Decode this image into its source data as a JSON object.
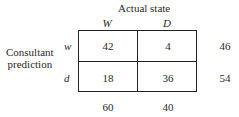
{
  "table": {
    "column_title": "Actual state",
    "row_title_line1": "Consultant",
    "row_title_line2": "prediction",
    "columns": [
      "W",
      "D"
    ],
    "rows": [
      {
        "label": "w",
        "values": [
          "42",
          "4"
        ],
        "total": "46"
      },
      {
        "label": "d",
        "values": [
          "18",
          "36"
        ],
        "total": "54"
      }
    ],
    "column_totals": [
      "60",
      "40"
    ]
  }
}
